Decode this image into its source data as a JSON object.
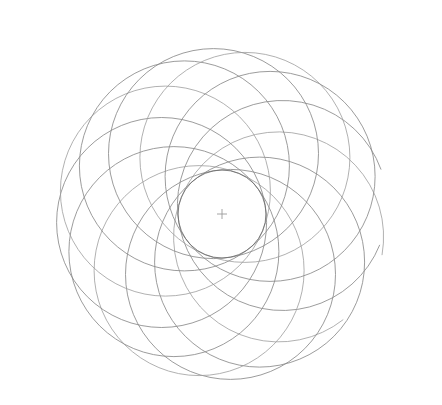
{
  "figure": {
    "background_color": "#ffffff",
    "stroke_color": "#8a8a8a",
    "stroke_color_faint": "#9d9d9d",
    "envelope_stroke_color": "#6f6f6f",
    "center_marker_color": "#9a9a9a",
    "stroke_width": 0.85,
    "canvas": {
      "width": 442,
      "height": 405
    }
  },
  "chart_data": {
    "type": "scatter",
    "xlabel": "",
    "ylabel": "",
    "grid": false,
    "legend": "none",
    "xlim": [
      0,
      442
    ],
    "ylim": [
      0,
      405
    ],
    "center": {
      "x": 222,
      "y": 214
    },
    "petal_count": 12,
    "circle_radius": 105,
    "center_orbit_radius": 61,
    "envelope_radius": 44,
    "phase_offset_deg": -8,
    "center_marker": {
      "x": 222,
      "y": 214,
      "arm_length": 5
    },
    "circles": [
      {
        "index": 0,
        "angle_deg": -8,
        "cx": 282.4,
        "cy": 205.5,
        "r": 105
      },
      {
        "index": 1,
        "angle_deg": 22,
        "cx": 278.6,
        "cy": 236.9,
        "r": 105
      },
      {
        "index": 2,
        "angle_deg": 52,
        "cx": 259.6,
        "cy": 262.1,
        "r": 105
      },
      {
        "index": 3,
        "angle_deg": 82,
        "cx": 230.5,
        "cy": 274.4,
        "r": 105
      },
      {
        "index": 4,
        "angle_deg": 112,
        "cx": 199.1,
        "cy": 270.6,
        "r": 105
      },
      {
        "index": 5,
        "angle_deg": 142,
        "cx": 173.9,
        "cy": 251.6,
        "r": 105
      },
      {
        "index": 6,
        "angle_deg": 172,
        "cx": 161.6,
        "cy": 222.5,
        "r": 105
      },
      {
        "index": 7,
        "angle_deg": 202,
        "cx": 165.4,
        "cy": 191.1,
        "r": 105
      },
      {
        "index": 8,
        "angle_deg": 232,
        "cx": 184.4,
        "cy": 165.9,
        "r": 105
      },
      {
        "index": 9,
        "angle_deg": 262,
        "cx": 213.5,
        "cy": 153.6,
        "r": 105
      },
      {
        "index": 10,
        "angle_deg": 292,
        "cx": 244.9,
        "cy": 157.4,
        "r": 105
      },
      {
        "index": 11,
        "angle_deg": 322,
        "cx": 270.1,
        "cy": 176.4,
        "r": 105
      }
    ],
    "open_arcs": [
      {
        "index": 0,
        "label": "right-upper-open-end",
        "end_x": 427,
        "end_y": 214
      },
      {
        "index": 1,
        "label": "right-lower-open-end",
        "end_x": 401,
        "end_y": 306
      }
    ],
    "extents": {
      "left": 18,
      "top": 20,
      "right": 428,
      "bottom": 402
    }
  }
}
